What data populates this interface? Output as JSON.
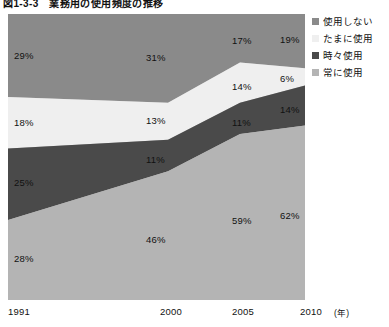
{
  "title": "図1-3-3　業務用の使用頻度の推移",
  "axis": {
    "ticks": [
      "1991",
      "2000",
      "2005",
      "2010"
    ],
    "unit": "(年)"
  },
  "legend": {
    "items": [
      {
        "label": "使用しない",
        "color": "#8a8a8a"
      },
      {
        "label": "たまに使用",
        "color": "#efefef"
      },
      {
        "label": "時々使用",
        "color": "#4a4a4a"
      },
      {
        "label": "常に使用",
        "color": "#b4b4b4"
      }
    ]
  },
  "chart_data": {
    "type": "area",
    "title": "図1-3-3　業務用の使用頻度の推移",
    "xlabel": "(年)",
    "ylabel": "",
    "ylim": [
      0,
      100
    ],
    "grid": false,
    "stacked": true,
    "normalized": true,
    "legend_position": "top-right",
    "x": [
      "1991",
      "2000",
      "2005",
      "2010"
    ],
    "categories": [
      "1991",
      "2000",
      "2005",
      "2010"
    ],
    "series": [
      {
        "name": "使用しない",
        "color": "#8a8a8a",
        "values": [
          29,
          31,
          17,
          19
        ],
        "labels": [
          "29%",
          "31%",
          "17%",
          "19%"
        ]
      },
      {
        "name": "たまに使用",
        "color": "#efefef",
        "values": [
          18,
          13,
          14,
          6
        ],
        "labels": [
          "18%",
          "13%",
          "14%",
          "6%"
        ]
      },
      {
        "name": "時々使用",
        "color": "#4a4a4a",
        "values": [
          25,
          11,
          11,
          14
        ],
        "labels": [
          "25%",
          "11%",
          "11%",
          "14%"
        ]
      },
      {
        "name": "常に使用",
        "color": "#b4b4b4",
        "values": [
          28,
          46,
          59,
          62
        ],
        "labels": [
          "28%",
          "46%",
          "59%",
          "62%"
        ]
      }
    ]
  },
  "labels": {
    "s0": {
      "v1991": "29%",
      "v2000": "31%",
      "v2005": "17%",
      "v2010": "19%"
    },
    "s1": {
      "v1991": "18%",
      "v2000": "13%",
      "v2005": "14%",
      "v2010": "6%"
    },
    "s2": {
      "v1991": "25%",
      "v2000": "11%",
      "v2005": "11%",
      "v2010": "14%"
    },
    "s3": {
      "v1991": "28%",
      "v2000": "46%",
      "v2005": "59%",
      "v2010": "62%"
    }
  }
}
